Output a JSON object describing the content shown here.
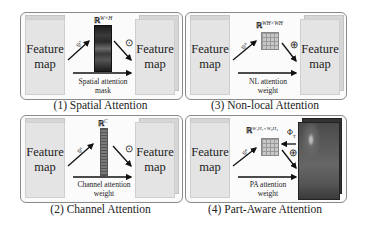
{
  "figure": {
    "panels": [
      {
        "id": "spatial",
        "caption": "(1) Spatial Attention",
        "input_label_line1": "Feature",
        "input_label_line2": "map",
        "output_label_line1": "Feature",
        "output_label_line2": "map",
        "space": "ℝ",
        "space_sup": "W×H",
        "psi": "ψˢ",
        "operator": "⊙",
        "bottom_label_line1": "Spatial attention",
        "bottom_label_line2": "mask",
        "attention_shape": "dark-heatmap-strip"
      },
      {
        "id": "nonlocal",
        "caption": "(3) Non-local Attention",
        "input_label_line1": "Feature",
        "input_label_line2": "map",
        "output_label_line1": "Feature",
        "output_label_line2": "map",
        "space": "ℝ",
        "space_sup": "WH×WH",
        "psi": "ψⁿ",
        "operator": "⊕",
        "bottom_label_line1": "NL attention",
        "bottom_label_line2": "weight",
        "attention_shape": "grid-matrix"
      },
      {
        "id": "channel",
        "caption": "(2) Channel Attention",
        "input_label_line1": "Feature",
        "input_label_line2": "map",
        "output_label_line1": "Feature",
        "output_label_line2": "map",
        "space": "ℝ",
        "space_sup": "C",
        "psi": "ψᶜ",
        "operator": "⊙",
        "bottom_label_line1": "Channel attention",
        "bottom_label_line2": "weight",
        "attention_shape": "vertical-vector"
      },
      {
        "id": "partaware",
        "caption": "(4) Part-Aware Attention",
        "input_label_line1": "Feature",
        "input_label_line2": "map",
        "space": "ℝ",
        "space_sup": "W₁H₁×W₂H₂",
        "psi": "ψᵉ",
        "phi": "Φ",
        "phi_sub": "T",
        "operator": "⊕",
        "bottom_label_line1": "PA attention",
        "bottom_label_line2": "weight",
        "attention_shape": "grid-matrix",
        "output_shape": "dark-part-feature-stack"
      }
    ]
  }
}
